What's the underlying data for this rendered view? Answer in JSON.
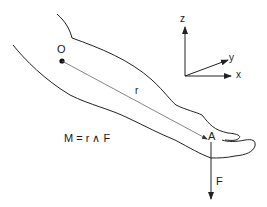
{
  "figure": {
    "point_origin_label": "O",
    "point_application_label": "A",
    "position_vector_label": "r",
    "force_label": "F",
    "equation": "M = r ∧ F",
    "axes": {
      "z_label": "z",
      "y_label": "y",
      "x_label": "x"
    },
    "colors": {
      "outline": "#222222",
      "vector": "#555555",
      "text": "#1a1a1a"
    }
  }
}
